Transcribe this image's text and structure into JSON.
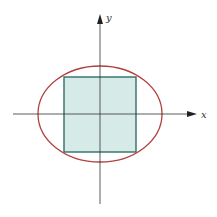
{
  "diagram": {
    "axes": {
      "x_label": "x",
      "y_label": "y",
      "origin": [
        100,
        114
      ],
      "x_axis": {
        "from": 13,
        "to": 196
      },
      "y_axis": {
        "from": 204,
        "to": 14
      }
    },
    "ellipse": {
      "cx": 100,
      "cy": 114,
      "rx": 62,
      "ry": 48,
      "stroke": "#b0413e"
    },
    "square": {
      "x": 64,
      "y": 77,
      "width": 72,
      "height": 75,
      "fill": "#d6ebe8",
      "stroke": "#2f6f66"
    },
    "colors": {
      "axis": "#333333",
      "background": "#ffffff"
    }
  }
}
